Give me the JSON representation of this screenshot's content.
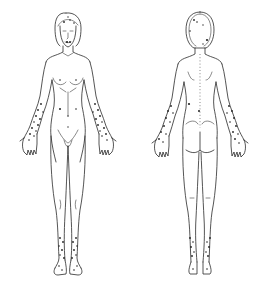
{
  "diagram": {
    "type": "anatomical body chart",
    "views": [
      {
        "id": "front",
        "label": "Anterior view",
        "center_x": 68
      },
      {
        "id": "back",
        "label": "Posterior view",
        "center_x": 200
      }
    ],
    "colors": {
      "background": "#ffffff",
      "line": "#2a2a2a",
      "marker": "#222222"
    },
    "marked_regions": {
      "front": [
        "forehead",
        "lips",
        "abdomen",
        "right forearm",
        "left forearm",
        "right hand",
        "left hand",
        "pubic area",
        "right lower leg",
        "left lower leg",
        "right foot",
        "left foot"
      ],
      "back": [
        "scalp",
        "occiput",
        "lower back",
        "right forearm",
        "left forearm",
        "right hand",
        "left hand",
        "right lower leg",
        "left lower leg",
        "right heel",
        "left heel"
      ]
    },
    "visible_text": []
  }
}
